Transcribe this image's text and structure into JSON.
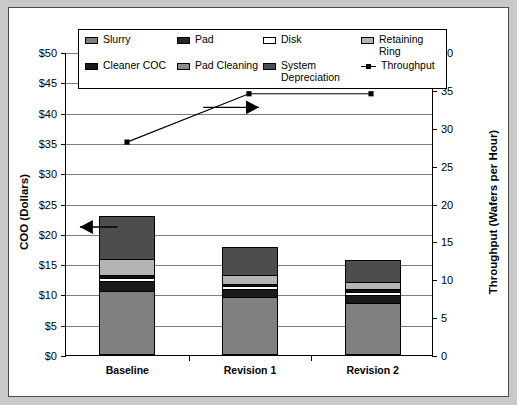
{
  "chart_data": {
    "type": "bar",
    "title": "",
    "subtitle": "",
    "categories": [
      "Baseline",
      "Revision 1",
      "Revision 2"
    ],
    "xlabel": "",
    "ylabel": "COO (Dollars)",
    "y2label": "Throughput (Wafers per Hour)",
    "ylim": [
      0,
      50
    ],
    "y2lim": [
      0,
      40
    ],
    "ytick_labels": [
      "$0",
      "$5",
      "$10",
      "$15",
      "$20",
      "$25",
      "$30",
      "$35",
      "$40",
      "$45",
      "$50"
    ],
    "ytick_values": [
      0,
      5,
      10,
      15,
      20,
      25,
      30,
      35,
      40,
      45,
      50
    ],
    "y2tick_labels": [
      "0",
      "5",
      "10",
      "15",
      "20",
      "25",
      "30",
      "35",
      "40"
    ],
    "y2tick_values": [
      0,
      5,
      10,
      15,
      20,
      25,
      30,
      35,
      40
    ],
    "grid": true,
    "legend_position": "top",
    "stacked": true,
    "series": [
      {
        "name": "Slurry",
        "color": "#808080",
        "values": [
          10.5,
          9.6,
          8.6
        ]
      },
      {
        "name": "Cleaner COC",
        "color": "#1a1a1a",
        "values": [
          1.7,
          1.3,
          1.3
        ]
      },
      {
        "name": "Disk",
        "color": "#ffffff",
        "values": [
          0.6,
          0.5,
          0.6
        ]
      },
      {
        "name": "Pad Cleaning",
        "color": "#101010",
        "values": [
          0.5,
          0.4,
          0.4
        ]
      },
      {
        "name": "Retaining Ring",
        "color": "#b4b4b4",
        "values": [
          2.6,
          1.5,
          1.3
        ]
      },
      {
        "name": "Pad",
        "color": "#262626",
        "values": [
          0.0,
          0.0,
          0.0
        ]
      },
      {
        "name": "System Depreciation",
        "color": "#4d4d4d",
        "values": [
          7.1,
          4.5,
          3.5
        ]
      }
    ],
    "totals": [
      23.0,
      17.8,
      15.7
    ],
    "line_series": {
      "name": "Throughput",
      "color": "#000000",
      "marker": "square",
      "axis": "right",
      "values": [
        28.2,
        34.6,
        34.6
      ]
    },
    "annotations": [
      {
        "name": "left-arrow",
        "points_to": "bars",
        "direction": "left",
        "value": 21.2
      },
      {
        "name": "right-arrow",
        "points_to": "throughput-line",
        "direction": "right",
        "value": 32.8
      }
    ]
  },
  "legend": {
    "items": [
      {
        "label": "Slurry",
        "swatch": "slurry-swatch",
        "type": "box",
        "color": "#808080"
      },
      {
        "label": "Pad",
        "swatch": "pad-swatch",
        "type": "box",
        "color": "#262626"
      },
      {
        "label": "Disk",
        "swatch": "disk-swatch",
        "type": "box",
        "color": "#ffffff"
      },
      {
        "label": "Retaining Ring",
        "swatch": "retaining-ring-swatch",
        "type": "box",
        "color": "#b4b4b4"
      },
      {
        "label": "Cleaner COC",
        "swatch": "cleaner-coc-swatch",
        "type": "box",
        "color": "#1a1a1a"
      },
      {
        "label": "Pad Cleaning",
        "swatch": "pad-cleaning-swatch",
        "type": "box",
        "color": "#8c8c8c"
      },
      {
        "label": "System Depreciation",
        "swatch": "system-depreciation-swatch",
        "type": "box",
        "color": "#4d4d4d"
      },
      {
        "label": "Throughput",
        "swatch": "throughput-marker",
        "type": "line",
        "color": "#000000"
      }
    ]
  }
}
